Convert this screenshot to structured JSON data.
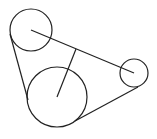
{
  "diagram": {
    "type": "belt-pulley",
    "stroke_color": "#222222",
    "background": "#ffffff",
    "pulleys": [
      {
        "name": "top-left-pulley",
        "cx": 31,
        "cy": 30,
        "r": 21
      },
      {
        "name": "large-bottom-pulley",
        "cx": 57,
        "cy": 97,
        "r": 30
      },
      {
        "name": "small-right-pulley",
        "cx": 134,
        "cy": 73,
        "r": 14
      }
    ],
    "center_line": {
      "x1": 31,
      "y1": 30,
      "x2": 134,
      "y2": 73
    },
    "perpendicular": {
      "x1": 57,
      "y1": 97,
      "x2": 76,
      "y2": 49
    },
    "belt_segments": [
      {
        "x1": 10,
        "y1": 34,
        "x2": 28,
        "y2": 100
      },
      {
        "x1": 75,
        "y1": 121,
        "x2": 138,
        "y2": 87
      }
    ]
  }
}
